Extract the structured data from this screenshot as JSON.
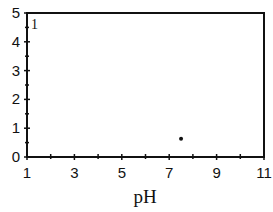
{
  "chart_data": {
    "type": "scatter",
    "title": "",
    "panel_label": "1",
    "xlabel": "pH",
    "ylabel": "",
    "xlim": [
      1,
      11
    ],
    "ylim": [
      0,
      5
    ],
    "xticks": [
      1,
      3,
      5,
      7,
      9,
      11
    ],
    "xticks_minor": [
      2,
      4,
      6,
      8,
      10
    ],
    "yticks": [
      0,
      1,
      2,
      3,
      4,
      5
    ],
    "yticks_minor": [
      0.5,
      1.5,
      2.5,
      3.5,
      4.5
    ],
    "grid": false,
    "legend": null,
    "series": [
      {
        "name": "data",
        "x": [
          7.5
        ],
        "y": [
          0.63
        ],
        "marker": "dot",
        "color": "#111111"
      }
    ]
  }
}
